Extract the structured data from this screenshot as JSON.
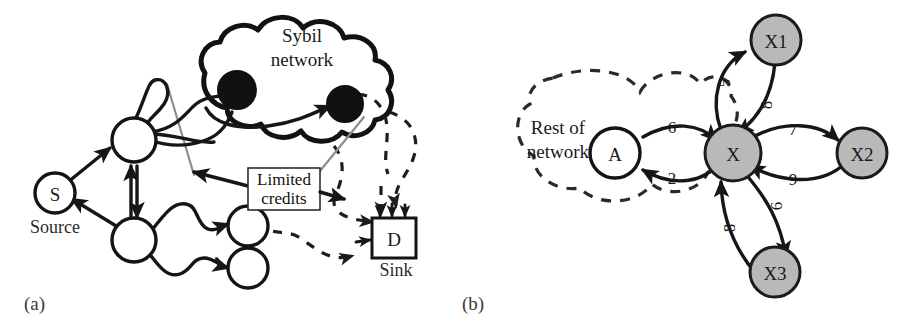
{
  "figure": {
    "background_color": "#ffffff",
    "colors": {
      "stroke": "#161616",
      "gray_node_fill": "#b9b9b9",
      "filled_node": "#111111",
      "cut_line": "#8d8d8d",
      "dashed_stroke": "#1d1d1d"
    }
  },
  "panels": [
    {
      "id": "a",
      "label": "(a)",
      "nodes": [
        {
          "id": "S",
          "label": "S",
          "caption": "Source",
          "style": "open-circle"
        },
        {
          "id": "n1",
          "label": "",
          "caption": "",
          "style": "open-circle"
        },
        {
          "id": "n2",
          "label": "",
          "caption": "",
          "style": "open-circle"
        },
        {
          "id": "n3",
          "label": "",
          "caption": "",
          "style": "open-circle"
        },
        {
          "id": "n4",
          "label": "",
          "caption": "",
          "style": "open-circle"
        },
        {
          "id": "sybil1",
          "label": "",
          "caption": "",
          "style": "filled-circle"
        },
        {
          "id": "sybil2",
          "label": "",
          "caption": "",
          "style": "filled-circle"
        },
        {
          "id": "D",
          "label": "D",
          "caption": "Sink",
          "style": "rect"
        }
      ],
      "cloud": {
        "lines": [
          "Sybil",
          "network"
        ]
      },
      "annotation_box": {
        "lines": [
          "Limited",
          "credits"
        ]
      }
    },
    {
      "id": "b",
      "label": "(b)",
      "cloud": {
        "lines": [
          "Rest of",
          "network"
        ]
      },
      "nodes": [
        {
          "id": "A",
          "label": "A",
          "style": "open-circle"
        },
        {
          "id": "X",
          "label": "X",
          "style": "gray-circle"
        },
        {
          "id": "X1",
          "label": "X1",
          "style": "gray-circle"
        },
        {
          "id": "X2",
          "label": "X2",
          "style": "gray-circle"
        },
        {
          "id": "X3",
          "label": "X3",
          "style": "gray-circle"
        }
      ],
      "edges": [
        {
          "from": "A",
          "to": "X",
          "weight": "6"
        },
        {
          "from": "X",
          "to": "A",
          "weight": "2"
        },
        {
          "from": "X",
          "to": "X1",
          "weight": "5"
        },
        {
          "from": "X1",
          "to": "X",
          "weight": "8"
        },
        {
          "from": "X",
          "to": "X2",
          "weight": "7"
        },
        {
          "from": "X2",
          "to": "X",
          "weight": "9"
        },
        {
          "from": "X",
          "to": "X3",
          "weight": "6"
        },
        {
          "from": "X3",
          "to": "X",
          "weight": "8"
        }
      ]
    }
  ]
}
